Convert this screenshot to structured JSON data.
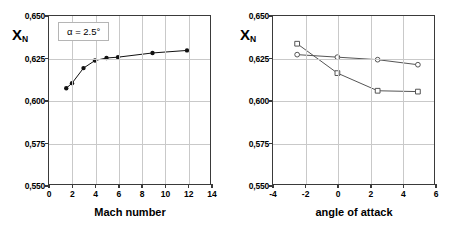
{
  "figure": {
    "panels": [
      "mach-number-panel",
      "angle-of-attack-panel"
    ]
  },
  "left_panel": {
    "ylabel_main": "X",
    "ylabel_sub": "N",
    "xlabel": "Mach number",
    "annotation": "α = 2.5°",
    "yticks": [
      "0,650",
      "0,625",
      "0,600",
      "0,575",
      "0,550"
    ],
    "xticks": [
      "0",
      "2",
      "4",
      "6",
      "8",
      "10",
      "12",
      "14"
    ]
  },
  "right_panel": {
    "ylabel_main": "X",
    "ylabel_sub": "N",
    "xlabel": "angle of attack",
    "yticks": [
      "0,650",
      "0,625",
      "0,600",
      "0,575",
      "0,550"
    ],
    "xticks": [
      "-4",
      "-2",
      "0",
      "2",
      "4",
      "6"
    ],
    "legend": [
      {
        "label": "M = 6",
        "marker": "circle"
      },
      {
        "label": "M = 1.5",
        "marker": "square"
      }
    ]
  },
  "chart_data": [
    {
      "type": "line",
      "id": "mach-number-chart",
      "title": "",
      "xlabel": "Mach number",
      "ylabel": "X_N",
      "annotation": "α = 2.5°",
      "xlim": [
        0,
        14
      ],
      "ylim": [
        0.55,
        0.65
      ],
      "xticks": [
        0,
        2,
        4,
        6,
        8,
        10,
        12,
        14
      ],
      "yticks": [
        0.55,
        0.575,
        0.6,
        0.625,
        0.65
      ],
      "grid": true,
      "decimal_separator": ",",
      "legend": null,
      "series": [
        {
          "name": "X_N vs Mach",
          "marker": "filled-circle",
          "color": "#111111",
          "x": [
            1.5,
            2.0,
            3.0,
            4.0,
            5.0,
            6.0,
            9.0,
            12.0
          ],
          "y": [
            0.607,
            0.61,
            0.619,
            0.6235,
            0.625,
            0.6255,
            0.628,
            0.6295
          ]
        }
      ]
    },
    {
      "type": "line",
      "id": "angle-of-attack-chart",
      "title": "",
      "xlabel": "angle of attack",
      "ylabel": "X_N",
      "xlim": [
        -4,
        6
      ],
      "ylim": [
        0.55,
        0.65
      ],
      "xticks": [
        -4,
        -2,
        0,
        2,
        4,
        6
      ],
      "yticks": [
        0.55,
        0.575,
        0.6,
        0.625,
        0.65
      ],
      "grid": true,
      "decimal_separator": ",",
      "legend_position": "top-right",
      "series": [
        {
          "name": "M = 6",
          "marker": "open-circle",
          "color": "#555555",
          "x": [
            -2.5,
            0.0,
            2.5,
            5.0
          ],
          "y": [
            0.627,
            0.6255,
            0.624,
            0.621
          ]
        },
        {
          "name": "M = 1.5",
          "marker": "open-square",
          "color": "#555555",
          "x": [
            -2.5,
            0.0,
            2.5,
            5.0
          ],
          "y": [
            0.6335,
            0.616,
            0.6055,
            0.605
          ]
        }
      ]
    }
  ]
}
